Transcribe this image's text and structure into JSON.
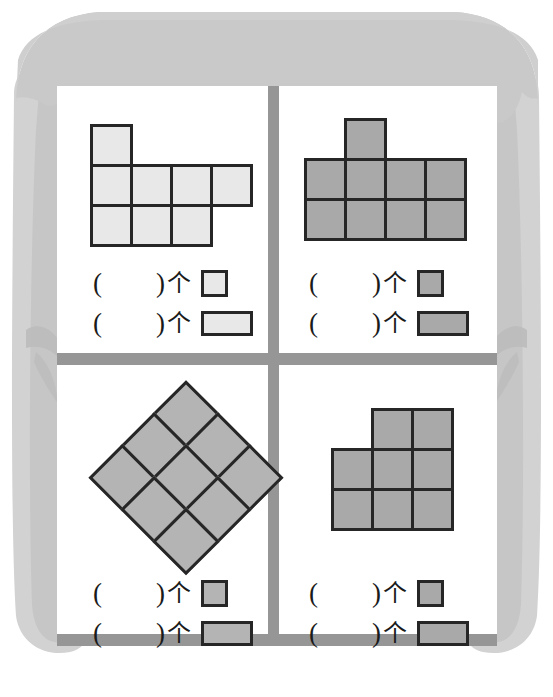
{
  "page": {
    "width": 553,
    "height": 697,
    "background": "#ffffff"
  },
  "theme": {
    "awning_color": "#c9c9c9",
    "curtain_color": "#d2d2d2",
    "curtain_shadow": "#bdbdbd",
    "frame_color": "#969696",
    "pane_color": "#ffffff",
    "outline_color": "#262626",
    "fill_light": "#e8e8e8",
    "fill_gray": "#a9a9a9",
    "text_color": "#1a1a1a"
  },
  "decor": {
    "awning_name": "scalloped-awning",
    "left_curtain_name": "left-curtain",
    "right_curtain_name": "right-curtain"
  },
  "legend_labels": {
    "open_paren": "(",
    "close_paren": ")",
    "blank": "      ",
    "unit": "个",
    "paren_text": "(        )"
  },
  "panels": [
    {
      "id": "top-left",
      "figure_name": "figure-top-left",
      "fill": "#e8e8e8",
      "cell_size": 43,
      "rows": [
        {
          "row": 0,
          "cols": [
            0
          ]
        },
        {
          "row": 1,
          "cols": [
            0,
            1,
            2,
            3
          ]
        },
        {
          "row": 2,
          "cols": [
            0,
            1,
            2
          ]
        }
      ],
      "square_count": 8,
      "rect_count": 0,
      "answers": [
        {
          "shape": "square",
          "label": "(        )",
          "unit": "个",
          "value": ""
        },
        {
          "shape": "rectangle",
          "label": "(        )",
          "unit": "个",
          "value": ""
        }
      ]
    },
    {
      "id": "top-right",
      "figure_name": "figure-top-right",
      "fill": "#a9a9a9",
      "cell_size": 43,
      "rows": [
        {
          "row": 0,
          "cols": [
            1
          ]
        },
        {
          "row": 1,
          "cols": [
            0,
            1,
            2,
            3
          ]
        },
        {
          "row": 2,
          "cols": [
            0,
            1,
            2,
            3
          ]
        }
      ],
      "square_count": 9,
      "rect_count": 0,
      "answers": [
        {
          "shape": "square",
          "label": "(        )",
          "unit": "个",
          "value": ""
        },
        {
          "shape": "rectangle",
          "label": "(        )",
          "unit": "个",
          "value": ""
        }
      ]
    },
    {
      "id": "bottom-left",
      "figure_name": "figure-bottom-left-diamond",
      "fill": "#b4b4b4",
      "cell_size": 48,
      "rotation_deg": 45,
      "rows": [
        {
          "row": 0,
          "cols": [
            0,
            1,
            2
          ]
        },
        {
          "row": 1,
          "cols": [
            0,
            1,
            2
          ]
        },
        {
          "row": 2,
          "cols": [
            0,
            1,
            2
          ]
        }
      ],
      "square_count": 9,
      "rect_count": 0,
      "answers": [
        {
          "shape": "square",
          "label": "(        )",
          "unit": "个",
          "value": ""
        },
        {
          "shape": "rectangle",
          "label": "(        )",
          "unit": "个",
          "value": ""
        }
      ]
    },
    {
      "id": "bottom-right",
      "figure_name": "figure-bottom-right",
      "fill": "#a9a9a9",
      "cell_size": 43,
      "rows": [
        {
          "row": 0,
          "cols": [
            1,
            2
          ]
        },
        {
          "row": 1,
          "cols": [
            0,
            1,
            2
          ]
        },
        {
          "row": 2,
          "cols": [
            0,
            1,
            2
          ]
        }
      ],
      "square_count": 8,
      "rect_count": 0,
      "answers": [
        {
          "shape": "square",
          "label": "(        )",
          "unit": "个",
          "value": ""
        },
        {
          "shape": "rectangle",
          "label": "(        )",
          "unit": "个",
          "value": ""
        }
      ]
    }
  ]
}
